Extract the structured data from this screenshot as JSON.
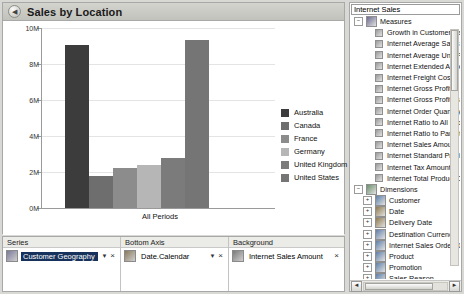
{
  "chart_panel": {
    "back_icon": "back-arrow-icon",
    "title": "Sales by Location"
  },
  "chart_data": {
    "type": "bar",
    "title": "Sales by Location",
    "categories": [
      "All Periods"
    ],
    "xlabel": "",
    "ylabel": "",
    "ylim": [
      0,
      10000000
    ],
    "ytick_labels": [
      "0M",
      "2M",
      "4M",
      "6M",
      "8M",
      "10M"
    ],
    "ytick_values": [
      0,
      2000000,
      4000000,
      6000000,
      8000000,
      10000000
    ],
    "grid": true,
    "legend_position": "right",
    "series": [
      {
        "name": "Australia",
        "values": [
          9050000
        ],
        "color": "#3c3c3c"
      },
      {
        "name": "Canada",
        "values": [
          1800000
        ],
        "color": "#6e6e6e"
      },
      {
        "name": "France",
        "values": [
          2250000
        ],
        "color": "#8c8c8c"
      },
      {
        "name": "Germany",
        "values": [
          2400000
        ],
        "color": "#b6b6b6"
      },
      {
        "name": "United Kingdom",
        "values": [
          2800000
        ],
        "color": "#7b7b7b"
      },
      {
        "name": "United States",
        "values": [
          9330000
        ],
        "color": "#757575"
      }
    ]
  },
  "drop_zones": [
    {
      "header": "Series",
      "icon": "hierarchy-icon",
      "chip": "Customer Geography",
      "selected": true,
      "caret": "▼",
      "close": "×",
      "has_caret": true
    },
    {
      "header": "Bottom Axis",
      "icon": "calendar-hierarchy-icon",
      "chip": "Date.Calendar",
      "selected": false,
      "caret": "▼",
      "close": "×",
      "has_caret": true
    },
    {
      "header": "Background",
      "icon": "measure-icon",
      "chip": "Internet Sales Amount",
      "selected": false,
      "caret": "",
      "close": "×",
      "has_caret": false
    }
  ],
  "metadata_pane": {
    "cube_selector_value": "Internet Sales",
    "tree": [
      {
        "level": 1,
        "label": "Measures",
        "icon": "measures-folder-icon",
        "expander": "−"
      },
      {
        "level": 2,
        "label": "Growth in Customer Base",
        "icon": "measure-icon",
        "expander": ""
      },
      {
        "level": 2,
        "label": "Internet Average Sales Amount",
        "icon": "measure-icon",
        "expander": ""
      },
      {
        "level": 2,
        "label": "Internet Average Unit Price",
        "icon": "measure-icon",
        "expander": ""
      },
      {
        "level": 2,
        "label": "Internet Extended Amount",
        "icon": "measure-icon",
        "expander": ""
      },
      {
        "level": 2,
        "label": "Internet Freight Cost",
        "icon": "measure-icon",
        "expander": ""
      },
      {
        "level": 2,
        "label": "Internet Gross Profit",
        "icon": "measure-icon",
        "expander": ""
      },
      {
        "level": 2,
        "label": "Internet Gross Profit Margin",
        "icon": "measure-icon",
        "expander": ""
      },
      {
        "level": 2,
        "label": "Internet Order Quantity",
        "icon": "measure-icon",
        "expander": ""
      },
      {
        "level": 2,
        "label": "Internet Ratio to All Products",
        "icon": "measure-icon",
        "expander": ""
      },
      {
        "level": 2,
        "label": "Internet Ratio to Parent Product",
        "icon": "measure-icon",
        "expander": ""
      },
      {
        "level": 2,
        "label": "Internet Sales Amount",
        "icon": "measure-icon",
        "expander": ""
      },
      {
        "level": 2,
        "label": "Internet Standard Product Cost",
        "icon": "measure-icon",
        "expander": ""
      },
      {
        "level": 2,
        "label": "Internet Tax Amount",
        "icon": "measure-icon",
        "expander": ""
      },
      {
        "level": 2,
        "label": "Internet Total Product Cost",
        "icon": "measure-icon",
        "expander": ""
      },
      {
        "level": 1,
        "label": "Dimensions",
        "icon": "dimensions-folder-icon",
        "expander": "−"
      },
      {
        "level": 2,
        "label": "Customer",
        "icon": "dimension-icon",
        "expander": "+"
      },
      {
        "level": 2,
        "label": "Date",
        "icon": "time-dimension-icon",
        "expander": "+"
      },
      {
        "level": 2,
        "label": "Delivery Date",
        "icon": "time-dimension-icon",
        "expander": "+"
      },
      {
        "level": 2,
        "label": "Destination Currency",
        "icon": "dimension-icon",
        "expander": "+"
      },
      {
        "level": 2,
        "label": "Internet Sales Order Details",
        "icon": "dimension-icon",
        "expander": "+"
      },
      {
        "level": 2,
        "label": "Product",
        "icon": "dimension-icon",
        "expander": "+"
      },
      {
        "level": 2,
        "label": "Promotion",
        "icon": "dimension-icon",
        "expander": "+"
      },
      {
        "level": 2,
        "label": "Sales Reason",
        "icon": "dimension-icon",
        "expander": "+"
      },
      {
        "level": 2,
        "label": "Sales Territory",
        "icon": "dimension-icon",
        "expander": "+"
      },
      {
        "level": 2,
        "label": "Ship Date",
        "icon": "time-dimension-icon",
        "expander": "+"
      }
    ],
    "hscroll_left": "◄",
    "hscroll_right": "►"
  }
}
